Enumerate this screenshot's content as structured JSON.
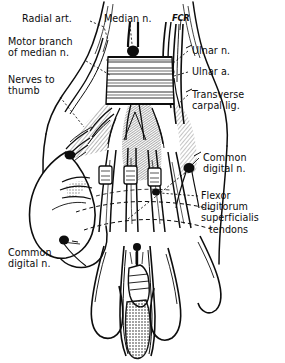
{
  "figure": {
    "orientation": "palmar view",
    "ink_color": "#0d0d0d",
    "background_color": "#ffffff"
  },
  "labels": {
    "radial_artery": "Radial art.",
    "median_nerve": "Median n.",
    "fcr": "FCR",
    "motor_branch_line1": "Motor branch",
    "motor_branch_line2": "of median n.",
    "nerves_to_thumb_line1": "Nerves to",
    "nerves_to_thumb_line2": "thumb",
    "ulnar_nerve": "Ulnar n.",
    "ulnar_artery": "Ulnar a.",
    "transverse_carpal_line1": "Transverse",
    "transverse_carpal_line2": "carpal lig.",
    "common_digital_right_line1": "Common",
    "common_digital_right_line2": "digital n.",
    "flexor_line1": "Flexor",
    "flexor_line2": "digitorum",
    "flexor_line3": "superficialis",
    "flexor_line4": "tendons",
    "common_digital_left_line1": "Common",
    "common_digital_left_line2": "digital n."
  },
  "structures": [
    {
      "name": "radial-artery",
      "side": "radial",
      "type": "artery"
    },
    {
      "name": "median-nerve",
      "side": "central",
      "type": "nerve"
    },
    {
      "name": "flexor-carpi-radialis-tendon",
      "side": "radial",
      "type": "tendon"
    },
    {
      "name": "motor-branch-of-median-nerve",
      "side": "radial",
      "type": "nerve-branch"
    },
    {
      "name": "nerves-to-thumb",
      "side": "radial",
      "type": "nerve-branch"
    },
    {
      "name": "ulnar-nerve",
      "side": "ulnar",
      "type": "nerve"
    },
    {
      "name": "ulnar-artery",
      "side": "ulnar",
      "type": "artery"
    },
    {
      "name": "transverse-carpal-ligament",
      "side": "central",
      "type": "ligament"
    },
    {
      "name": "common-digital-nerve",
      "side": "palmar",
      "type": "nerve-branch"
    },
    {
      "name": "flexor-digitorum-superficialis-tendons",
      "side": "palmar",
      "type": "tendon"
    }
  ]
}
